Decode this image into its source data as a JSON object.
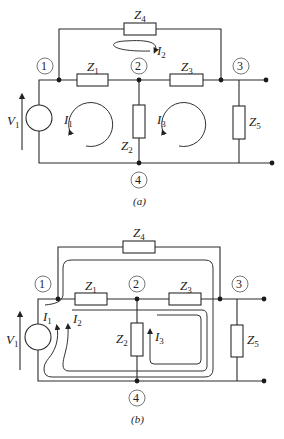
{
  "diagram_a": {
    "caption": "(a)",
    "nodes": [
      "1",
      "2",
      "3",
      "4"
    ],
    "source": {
      "name": "V",
      "sub": "1"
    },
    "impedances": [
      {
        "name": "Z",
        "sub": "1"
      },
      {
        "name": "Z",
        "sub": "2"
      },
      {
        "name": "Z",
        "sub": "3"
      },
      {
        "name": "Z",
        "sub": "4"
      },
      {
        "name": "Z",
        "sub": "5"
      }
    ],
    "currents": [
      {
        "name": "I",
        "sub": "1"
      },
      {
        "name": "I",
        "sub": "2"
      },
      {
        "name": "I",
        "sub": "3"
      }
    ]
  },
  "diagram_b": {
    "caption": "(b)",
    "nodes": [
      "1",
      "2",
      "3",
      "4"
    ],
    "source": {
      "name": "V",
      "sub": "1"
    },
    "impedances": [
      {
        "name": "Z",
        "sub": "1"
      },
      {
        "name": "Z",
        "sub": "2"
      },
      {
        "name": "Z",
        "sub": "3"
      },
      {
        "name": "Z",
        "sub": "4"
      },
      {
        "name": "Z",
        "sub": "5"
      }
    ],
    "currents": [
      {
        "name": "I",
        "sub": "1"
      },
      {
        "name": "I",
        "sub": "2"
      },
      {
        "name": "I",
        "sub": "3"
      }
    ]
  }
}
